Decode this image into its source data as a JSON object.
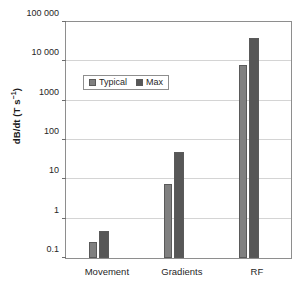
{
  "chart_data": {
    "type": "bar",
    "title": "",
    "xlabel": "",
    "ylabel": "dB/dt (T s⁻¹)",
    "ylabel_main": "dB/dt (T s",
    "ylabel_exponent": "−1",
    "ylabel_tail": ")",
    "categories": [
      "Movement",
      "Gradients",
      "RF"
    ],
    "series": [
      {
        "name": "Typical",
        "color": "#808080",
        "values": [
          0.25,
          7.5,
          8000
        ]
      },
      {
        "name": "Max",
        "color": "#575757",
        "values": [
          0.5,
          50,
          40000
        ]
      }
    ],
    "yscale": "log",
    "ylim": [
      0.1,
      100000
    ],
    "yticks": [
      0.1,
      1,
      10,
      100,
      1000,
      10000,
      100000
    ],
    "ytick_labels": [
      "0.1",
      "1",
      "10",
      "100",
      "1000",
      "10 000",
      "100 000"
    ],
    "grid": true,
    "grid_axis": "y",
    "legend": {
      "position": "upper-left-inset",
      "entries": [
        "Typical",
        "Max"
      ]
    }
  }
}
